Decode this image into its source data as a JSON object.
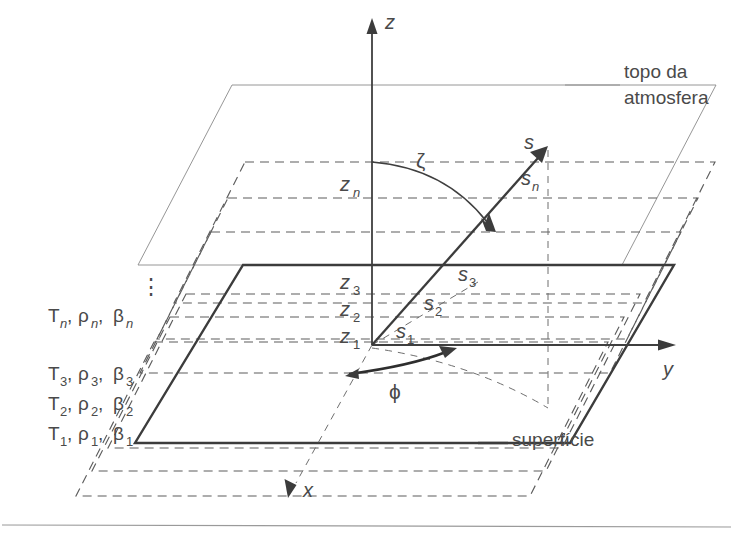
{
  "figure": {
    "title_alt": "Plane-parallel atmosphere layer geometry",
    "language": "pt",
    "background_color": "#ffffff",
    "line_color": "#4a4a4a"
  },
  "annotations": {
    "top_of_atmosphere_line1": "topo da",
    "top_of_atmosphere_line2": "atmosfera",
    "surface": "superfície",
    "ellipsis": "⋮"
  },
  "axes": [
    {
      "name": "z-axis",
      "label": "z",
      "direction": "up"
    },
    {
      "name": "y-axis",
      "label": "y",
      "direction": "right"
    },
    {
      "name": "x-axis",
      "label": "x",
      "direction": "down-left"
    }
  ],
  "angles": [
    {
      "name": "zenith-angle",
      "symbol": "ζ",
      "description": "zenith angle between z-axis and path s"
    },
    {
      "name": "azimuth-angle",
      "symbol": "ϕ",
      "description": "azimuth angle in the horizontal plane"
    }
  ],
  "heights": [
    {
      "label": "z",
      "sub": "1"
    },
    {
      "label": "z",
      "sub": "2"
    },
    {
      "label": "z",
      "sub": "3"
    },
    {
      "label": "z",
      "sub": "n"
    }
  ],
  "path_segments": [
    {
      "label": "s",
      "sub": "1"
    },
    {
      "label": "s",
      "sub": "2"
    },
    {
      "label": "s",
      "sub": "3"
    },
    {
      "label": "s",
      "sub": "n"
    },
    {
      "label": "s",
      "sub": ""
    }
  ],
  "layers": [
    {
      "index": "1",
      "temperature": "T",
      "density": "ρ",
      "extinction": "β",
      "text": "T₁, ρ₁, β₁"
    },
    {
      "index": "2",
      "temperature": "T",
      "density": "ρ",
      "extinction": "β",
      "text": "T₂, ρ₂, β₂"
    },
    {
      "index": "3",
      "temperature": "T",
      "density": "ρ",
      "extinction": "β",
      "text": "T₃, ρ₃, β₃"
    },
    {
      "index": "n",
      "temperature": "T",
      "density": "ρ",
      "extinction": "β",
      "text": "Tₙ, ρₙ, βₙ"
    }
  ],
  "symbols": {
    "T": "T",
    "rho": "ρ",
    "beta": "β",
    "comma": ",",
    "s": "s",
    "z": "z",
    "x": "x",
    "y": "y",
    "zeta": "ζ",
    "phi": "ϕ",
    "sub_1": "1",
    "sub_2": "2",
    "sub_3": "3",
    "sub_n": "n"
  }
}
